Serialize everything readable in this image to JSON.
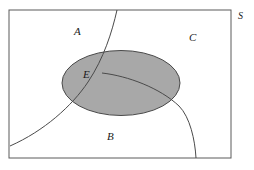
{
  "figure": {
    "kind": "set-partition-diagram",
    "background_color": "#ffffff",
    "stroke_color": "#5a5a5a",
    "label_color": "#1a1a1a",
    "ellipse_fill_color": "#a8a8a8",
    "ellipse_stroke_color": "#4a4a4a"
  },
  "universe": {
    "label": "S",
    "label_x": 238,
    "label_y": 19,
    "rect": {
      "x": 9,
      "y": 10,
      "width": 222,
      "height": 148
    }
  },
  "regions": [
    {
      "name": "region-a",
      "label": "A",
      "label_x": 74,
      "label_y": 35,
      "description": "upper-left region"
    },
    {
      "name": "region-b",
      "label": "B",
      "label_x": 107,
      "label_y": 140,
      "description": "lower region"
    },
    {
      "name": "region-c",
      "label": "C",
      "label_x": 189,
      "label_y": 41,
      "description": "upper-right region"
    }
  ],
  "event": {
    "name": "event-e",
    "label": "E",
    "label_x": 83,
    "label_y": 78,
    "shape": "ellipse",
    "cx": 121,
    "cy": 83,
    "rx": 59,
    "ry": 32.5
  },
  "dividers": [
    {
      "name": "divider-a-b",
      "path": "M 117 10 C 112 32, 104 58, 88 82 C 72 106, 44 131, 10 146"
    },
    {
      "name": "divider-b-c",
      "path": "M 102 73 C 128 76, 160 88, 179 106 C 190 117, 195 140, 196 158"
    }
  ],
  "labels_style": {
    "font_style": "italic",
    "region_font_size_px": 11,
    "universe_font_size_px": 10
  }
}
